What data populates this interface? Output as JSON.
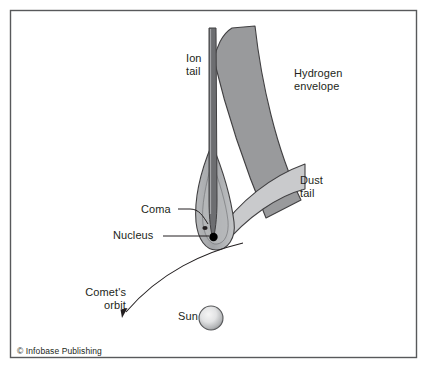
{
  "figure": {
    "type": "diagram",
    "background_color": "#ffffff",
    "frame": {
      "stroke": "#58595b",
      "x": 10,
      "y": 10,
      "width": 407,
      "height": 348
    }
  },
  "labels": {
    "ion_tail": "Ion\ntail",
    "hydrogen_envelope": "Hydrogen\nenvelope",
    "dust_tail": "Dust\ntail",
    "coma": "Coma",
    "nucleus": "Nucleus",
    "comets_orbit": "Comet's\norbit",
    "sun": "Sun",
    "copyright": "© Infobase Publishing"
  },
  "icon_names": {
    "ion_tail": "ion-tail-shape",
    "hydrogen_envelope": "hydrogen-envelope-shape",
    "dust_tail": "dust-tail-shape",
    "coma": "coma-shape",
    "nucleus": "nucleus-dot",
    "sun": "sun-sphere",
    "orbit": "orbit-curve-arrow"
  },
  "colors": {
    "ion_tail": "#6d6e71",
    "ion_tail_stroke": "#414042",
    "hydrogen_envelope": "#999a9c",
    "hydrogen_envelope_stroke": "#414042",
    "dust_tail": "#c9cacc",
    "dust_tail_stroke": "#414042",
    "coma_outer": "#a7a9ac",
    "coma_inner": "#bcbec0",
    "coma_stroke": "#414042",
    "nucleus": "#000000",
    "sun_center": "#f1f1f1",
    "sun_edge": "#8b8d8f",
    "sun_stroke": "#58595b",
    "leader_line": "#231f20",
    "text": "#231f20",
    "frame": "#58595b"
  },
  "geometry": {
    "sun": {
      "cx": 211,
      "cy": 318,
      "r": 12
    },
    "nucleus": {
      "cx": 213,
      "cy": 237,
      "r": 4
    },
    "orbit_arrow_tip": {
      "x": 122,
      "y": 317
    },
    "ion_tail_top_y": 28,
    "hydrogen_envelope_top_y": 26,
    "dust_tail_right_x": 305
  }
}
